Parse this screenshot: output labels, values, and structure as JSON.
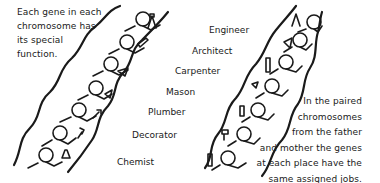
{
  "caption_left": {
    "lines": [
      "Each gene in each",
      "chromosome has",
      "its special",
      "function."
    ]
  },
  "caption_right": {
    "lines": [
      "In the paired",
      "chromosomes",
      "from the father",
      "and mother the genes",
      "at each place have the",
      "same assigned jobs."
    ]
  },
  "gene_labels": [
    {
      "label": "Engineer",
      "tool_icon": "compass-icon"
    },
    {
      "label": "Architect",
      "tool_icon": "set-square-icon"
    },
    {
      "label": "Carpenter",
      "tool_icon": "saw-icon"
    },
    {
      "label": "Mason",
      "tool_icon": "trowel-icon"
    },
    {
      "label": "Plumber",
      "tool_icon": "blowtorch-icon"
    },
    {
      "label": "Decorator",
      "tool_icon": "paintbrush-icon"
    },
    {
      "label": "Chemist",
      "tool_icon": "flask-icon"
    }
  ],
  "colors": {
    "ink": "#1a1a1a",
    "background": "#ffffff"
  }
}
